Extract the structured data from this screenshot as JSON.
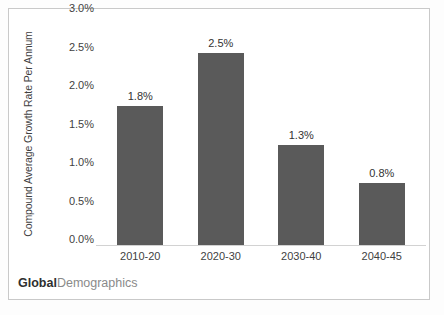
{
  "chart_data": {
    "type": "bar",
    "title": "",
    "xlabel": "",
    "ylabel": "Compound Average Growth Rate Per Annum",
    "categories": [
      "2010-20",
      "2020-30",
      "2030-40",
      "2040-45"
    ],
    "values": [
      1.8,
      2.5,
      1.3,
      0.8
    ],
    "value_labels": [
      "1.8%",
      "2.5%",
      "1.3%",
      "0.8%"
    ],
    "ylim": [
      0.0,
      3.0
    ],
    "ytick_values": [
      0.0,
      0.5,
      1.0,
      1.5,
      2.0,
      2.5,
      3.0
    ],
    "ytick_labels": [
      "0.0%",
      "0.5%",
      "1.0%",
      "1.5%",
      "2.0%",
      "2.5%",
      "3.0%"
    ],
    "grid": false,
    "legend": null,
    "series": [
      {
        "name": "Compound Average Growth Rate Per Annum",
        "values": [
          1.8,
          2.5,
          1.3,
          0.8
        ]
      }
    ],
    "colors": {
      "bar_fill": "#5a5a5a",
      "axis_line": "#d2d2d2",
      "frame_border": "#c9c9c9",
      "plot_background": "#ffffff",
      "tick_text": "#3f3f3f",
      "value_text": "#333333"
    }
  },
  "watermark": {
    "bold_part": "Global",
    "light_part": "Demographics"
  }
}
